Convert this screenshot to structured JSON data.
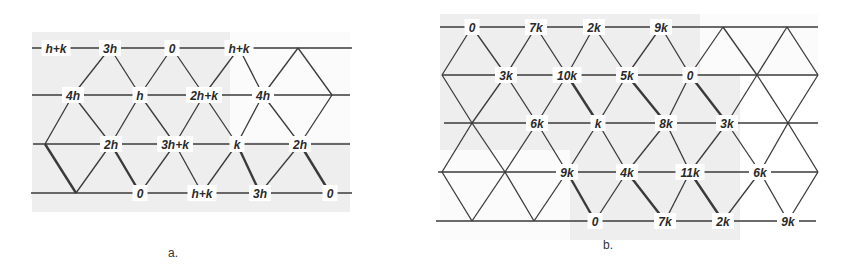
{
  "figure": {
    "panels": [
      {
        "id": "a",
        "caption": "a.",
        "shade": {
          "x": 32,
          "y": 32,
          "w": 318,
          "h": 180
        },
        "rows": [
          {
            "y": 48,
            "x1": 32,
            "x2": 352,
            "crossings": [
              298
            ],
            "nodes": [
              {
                "x": 56,
                "label": "h+k"
              },
              {
                "x": 110,
                "label": "3h"
              },
              {
                "x": 172,
                "label": "0"
              },
              {
                "x": 239,
                "label": "h+k"
              }
            ]
          },
          {
            "y": 95,
            "x1": 32,
            "x2": 350,
            "crossings": [
              332
            ],
            "nodes": [
              {
                "x": 73,
                "label": "4h"
              },
              {
                "x": 140,
                "label": "h"
              },
              {
                "x": 204,
                "label": "2h+k"
              },
              {
                "x": 263,
                "label": "4h"
              }
            ]
          },
          {
            "y": 144,
            "x1": 33,
            "x2": 350,
            "crossings": [
              45
            ],
            "nodes": [
              {
                "x": 111,
                "label": "2h"
              },
              {
                "x": 175,
                "label": "3h+k"
              },
              {
                "x": 237,
                "label": "k"
              },
              {
                "x": 300,
                "label": "2h"
              }
            ]
          },
          {
            "y": 193,
            "x1": 31,
            "x2": 352,
            "crossings": [
              76
            ],
            "nodes": [
              {
                "x": 140,
                "label": "0"
              },
              {
                "x": 202,
                "label": "h+k"
              },
              {
                "x": 260,
                "label": "3h"
              },
              {
                "x": 330,
                "label": "0"
              }
            ]
          }
        ]
      },
      {
        "id": "b",
        "caption": "b.",
        "shade": {
          "x": 440,
          "y": 14,
          "w": 378,
          "h": 226
        },
        "rows": [
          {
            "y": 27,
            "x1": 440,
            "x2": 818,
            "crossings": [
              723,
              787
            ],
            "nodes": [
              {
                "x": 472,
                "label": "0"
              },
              {
                "x": 536,
                "label": "7k"
              },
              {
                "x": 594,
                "label": "2k"
              },
              {
                "x": 661,
                "label": "9k"
              }
            ]
          },
          {
            "y": 75,
            "x1": 442,
            "x2": 818,
            "crossings": [
              442,
              757,
              818
            ],
            "nodes": [
              {
                "x": 506,
                "label": "3k"
              },
              {
                "x": 567,
                "label": "10k"
              },
              {
                "x": 627,
                "label": "5k"
              },
              {
                "x": 690,
                "label": "0"
              }
            ]
          },
          {
            "y": 123,
            "x1": 444,
            "x2": 818,
            "crossings": [
              472,
              788
            ],
            "nodes": [
              {
                "x": 537,
                "label": "6k"
              },
              {
                "x": 598,
                "label": "k"
              },
              {
                "x": 666,
                "label": "8k"
              },
              {
                "x": 727,
                "label": "3k"
              }
            ]
          },
          {
            "y": 172,
            "x1": 438,
            "x2": 818,
            "crossings": [
              442,
              505,
              818
            ],
            "nodes": [
              {
                "x": 567,
                "label": "9k"
              },
              {
                "x": 627,
                "label": "4k"
              },
              {
                "x": 690,
                "label": "11k"
              },
              {
                "x": 760,
                "label": "6k"
              }
            ]
          },
          {
            "y": 221,
            "x1": 436,
            "x2": 816,
            "crossings": [
              472,
              534
            ],
            "nodes": [
              {
                "x": 595,
                "label": "0"
              },
              {
                "x": 665,
                "label": "7k"
              },
              {
                "x": 723,
                "label": "2k"
              },
              {
                "x": 788,
                "label": "9k"
              }
            ]
          }
        ]
      }
    ]
  },
  "captions": {
    "a": "a.",
    "b": "b."
  }
}
